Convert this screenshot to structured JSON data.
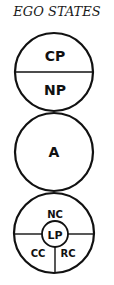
{
  "title": "EGO STATES",
  "colors": {
    "stroke": "#111111",
    "background": "#ffffff"
  },
  "diagram": {
    "parent": {
      "top_label": "CP",
      "bottom_label": "NP"
    },
    "adult": {
      "label": "A"
    },
    "child": {
      "top_label": "NC",
      "center_label": "LP",
      "left_label": "CC",
      "right_label": "RC"
    }
  }
}
